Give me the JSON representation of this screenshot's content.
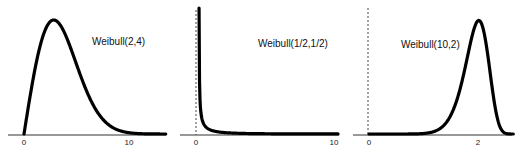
{
  "chart_data": [
    {
      "type": "line",
      "title": "Weibull(2,4)",
      "xlabel": "",
      "ylabel": "",
      "x_ticks": [
        "0",
        "10"
      ],
      "xlim": [
        -1.5,
        13.5
      ],
      "shape": 2,
      "scale": 4,
      "x": [
        0,
        1,
        2,
        2.83,
        4,
        5,
        6,
        7,
        8,
        9,
        10,
        12,
        13.5
      ],
      "y": [
        0,
        0.117,
        0.195,
        0.214,
        0.184,
        0.131,
        0.079,
        0.041,
        0.018,
        0.007,
        0.002,
        0.0001,
        0
      ],
      "grid": false
    },
    {
      "type": "line",
      "title": "Weibull(1/2,1/2)",
      "xlabel": "",
      "ylabel": "",
      "x_ticks": [
        "0",
        "10"
      ],
      "xlim": [
        -1.2,
        10.5
      ],
      "shape": 0.5,
      "scale": 0.5,
      "x": [
        0.01,
        0.05,
        0.1,
        0.25,
        0.5,
        1,
        2,
        4,
        6,
        10
      ],
      "y": [
        6.51,
        2.58,
        1.8,
        1.0,
        0.52,
        0.24,
        0.09,
        0.021,
        0.006,
        0.0008
      ],
      "dashed_vline_at_x": 0,
      "grid": false
    },
    {
      "type": "line",
      "title": "Weibull(10,2)",
      "xlabel": "",
      "ylabel": "",
      "x_ticks": [
        "0",
        "2"
      ],
      "xlim": [
        -0.27,
        2.6
      ],
      "shape": 10,
      "scale": 2,
      "x": [
        0,
        1,
        1.4,
        1.6,
        1.8,
        1.93,
        2.0,
        2.2,
        2.4,
        2.6
      ],
      "y": [
        0,
        0.005,
        0.19,
        0.55,
        1.17,
        1.78,
        1.84,
        1.01,
        0.12,
        0.001
      ],
      "dashed_vline_at_x": 0,
      "grid": false
    }
  ],
  "panels": [
    {
      "label": "Weibull(2,4)",
      "tick_left": "0",
      "tick_right": "10"
    },
    {
      "label": "Weibull(1/2,1/2)",
      "tick_left": "0",
      "tick_right": "10"
    },
    {
      "label": "Weibull(10,2)",
      "tick_left": "0",
      "tick_right": "2"
    }
  ]
}
